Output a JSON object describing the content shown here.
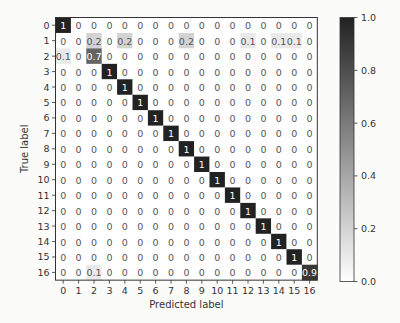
{
  "chart_data": {
    "type": "heatmap",
    "title": "",
    "xlabel": "Predicted label",
    "ylabel": "True label",
    "x_categories": [
      "0",
      "1",
      "2",
      "3",
      "4",
      "5",
      "6",
      "7",
      "8",
      "9",
      "10",
      "11",
      "12",
      "13",
      "14",
      "15",
      "16"
    ],
    "y_categories": [
      "0",
      "1",
      "2",
      "3",
      "4",
      "5",
      "6",
      "7",
      "8",
      "9",
      "10",
      "11",
      "12",
      "13",
      "14",
      "15",
      "16"
    ],
    "matrix": [
      [
        1,
        0,
        0,
        0,
        0,
        0,
        0,
        0,
        0,
        0,
        0,
        0,
        0,
        0,
        0,
        0,
        0
      ],
      [
        0,
        0,
        0.2,
        0,
        0.2,
        0,
        0,
        0,
        0.2,
        0,
        0,
        0,
        0.1,
        0,
        0.1,
        0.1,
        0
      ],
      [
        0.1,
        0,
        0.7,
        0,
        0,
        0,
        0,
        0,
        0,
        0,
        0,
        0,
        0,
        0,
        0,
        0,
        0
      ],
      [
        0,
        0,
        0,
        1,
        0,
        0,
        0,
        0,
        0,
        0,
        0,
        0,
        0,
        0,
        0,
        0,
        0
      ],
      [
        0,
        0,
        0,
        0,
        1,
        0,
        0,
        0,
        0,
        0,
        0,
        0,
        0,
        0,
        0,
        0,
        0
      ],
      [
        0,
        0,
        0,
        0,
        0,
        1,
        0,
        0,
        0,
        0,
        0,
        0,
        0,
        0,
        0,
        0,
        0
      ],
      [
        0,
        0,
        0,
        0,
        0,
        0,
        1,
        0,
        0,
        0,
        0,
        0,
        0,
        0,
        0,
        0,
        0
      ],
      [
        0,
        0,
        0,
        0,
        0,
        0,
        0,
        1,
        0,
        0,
        0,
        0,
        0,
        0,
        0,
        0,
        0
      ],
      [
        0,
        0,
        0,
        0,
        0,
        0,
        0,
        0,
        1,
        0,
        0,
        0,
        0,
        0,
        0,
        0,
        0
      ],
      [
        0,
        0,
        0,
        0,
        0,
        0,
        0,
        0,
        0,
        1,
        0,
        0,
        0,
        0,
        0,
        0,
        0
      ],
      [
        0,
        0,
        0,
        0,
        0,
        0,
        0,
        0,
        0,
        0,
        1,
        0,
        0,
        0,
        0,
        0,
        0
      ],
      [
        0,
        0,
        0,
        0,
        0,
        0,
        0,
        0,
        0,
        0,
        0,
        1,
        0,
        0,
        0,
        0,
        0
      ],
      [
        0,
        0,
        0,
        0,
        0,
        0,
        0,
        0,
        0,
        0,
        0,
        0,
        1,
        0,
        0,
        0,
        0
      ],
      [
        0,
        0,
        0,
        0,
        0,
        0,
        0,
        0,
        0,
        0,
        0,
        0,
        0,
        1,
        0,
        0,
        0
      ],
      [
        0,
        0,
        0,
        0,
        0,
        0,
        0,
        0,
        0,
        0,
        0,
        0,
        0,
        0,
        1,
        0,
        0
      ],
      [
        0,
        0,
        0,
        0,
        0,
        0,
        0,
        0,
        0,
        0,
        0,
        0,
        0,
        0,
        0,
        1,
        0
      ],
      [
        0,
        0,
        0.1,
        0,
        0,
        0,
        0,
        0,
        0,
        0,
        0,
        0,
        0,
        0,
        0,
        0,
        0.9
      ]
    ],
    "colorbar": {
      "range": [
        0.0,
        1.0
      ],
      "ticks": [
        "0.0",
        "0.2",
        "0.4",
        "0.6",
        "0.8",
        "1.0"
      ],
      "colormap": "Greys",
      "low_color": "#ffffff",
      "high_color": "#222222"
    },
    "grid": false,
    "legend": "colorbar-right"
  }
}
